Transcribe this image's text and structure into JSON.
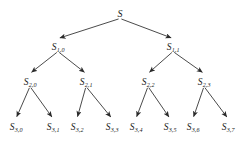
{
  "diagram": {
    "type": "binary-tree",
    "title": "",
    "background_color": "#ffffff",
    "edge_color": "#2a2a2a",
    "label_color": "#1a1a1a",
    "levels": 4,
    "nodes": [
      {
        "id": "root",
        "base": "S",
        "sub": "",
        "x": 120,
        "y": 12,
        "level": 0
      },
      {
        "id": "n1_0",
        "base": "S",
        "sub": "1,0",
        "x": 58,
        "y": 45,
        "level": 1
      },
      {
        "id": "n1_1",
        "base": "S",
        "sub": "1,1",
        "x": 173,
        "y": 45,
        "level": 1
      },
      {
        "id": "n2_0",
        "base": "S",
        "sub": "2,0",
        "x": 30,
        "y": 80,
        "level": 2
      },
      {
        "id": "n2_1",
        "base": "S",
        "sub": "2,1",
        "x": 86,
        "y": 80,
        "level": 2
      },
      {
        "id": "n2_2",
        "base": "S",
        "sub": "2,2",
        "x": 148,
        "y": 80,
        "level": 2
      },
      {
        "id": "n2_3",
        "base": "S",
        "sub": "2,3",
        "x": 204,
        "y": 80,
        "level": 2
      },
      {
        "id": "n3_0",
        "base": "S",
        "sub": "3,0",
        "x": 16,
        "y": 125,
        "level": 3
      },
      {
        "id": "n3_1",
        "base": "S",
        "sub": "3,1",
        "x": 53,
        "y": 125,
        "level": 3
      },
      {
        "id": "n3_2",
        "base": "S",
        "sub": "3,2",
        "x": 77,
        "y": 125,
        "level": 3
      },
      {
        "id": "n3_3",
        "base": "S",
        "sub": "3,3",
        "x": 112,
        "y": 125,
        "level": 3
      },
      {
        "id": "n3_4",
        "base": "S",
        "sub": "3,4",
        "x": 136,
        "y": 125,
        "level": 3
      },
      {
        "id": "n3_5",
        "base": "S",
        "sub": "3,5",
        "x": 170,
        "y": 125,
        "level": 3
      },
      {
        "id": "n3_6",
        "base": "S",
        "sub": "3,6",
        "x": 193,
        "y": 125,
        "level": 3
      },
      {
        "id": "n3_7",
        "base": "S",
        "sub": "3,7",
        "x": 228,
        "y": 125,
        "level": 3
      }
    ],
    "edges": [
      {
        "from": "root",
        "to": "n1_0"
      },
      {
        "from": "root",
        "to": "n1_1"
      },
      {
        "from": "n1_0",
        "to": "n2_0"
      },
      {
        "from": "n1_0",
        "to": "n2_1"
      },
      {
        "from": "n1_1",
        "to": "n2_2"
      },
      {
        "from": "n1_1",
        "to": "n2_3"
      },
      {
        "from": "n2_0",
        "to": "n3_0"
      },
      {
        "from": "n2_0",
        "to": "n3_1"
      },
      {
        "from": "n2_1",
        "to": "n3_2"
      },
      {
        "from": "n2_1",
        "to": "n3_3"
      },
      {
        "from": "n2_2",
        "to": "n3_4"
      },
      {
        "from": "n2_2",
        "to": "n3_5"
      },
      {
        "from": "n2_3",
        "to": "n3_6"
      },
      {
        "from": "n2_3",
        "to": "n3_7"
      }
    ]
  }
}
